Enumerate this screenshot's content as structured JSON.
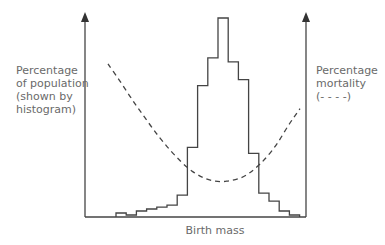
{
  "labels": {
    "left_axis": [
      "Percentage",
      "of population",
      "(shown by",
      "histogram)"
    ],
    "right_axis": [
      "Percentage",
      "mortality",
      "(- - - -)"
    ],
    "x_axis": "Birth mass"
  },
  "colors": {
    "line": "#444444",
    "text": "#6a6a6a"
  },
  "chart_data": {
    "type": "bar",
    "title": "",
    "xlabel": "Birth mass",
    "ylabel": "Percentage of population (shown by histogram)",
    "y2label": "Percentage mortality (dashed)",
    "series": [
      {
        "name": "Percentage of population (histogram)",
        "style": "step",
        "values": [
          2,
          1,
          3,
          4,
          5,
          6,
          11,
          35,
          66,
          80,
          100,
          78,
          69,
          32,
          12,
          8,
          3,
          1
        ]
      },
      {
        "name": "Percentage mortality (dashed)",
        "style": "dashed-curve",
        "values": [
          74,
          64,
          53,
          43,
          33,
          24,
          16,
          9,
          4,
          1,
          0,
          1,
          3,
          8,
          15,
          24,
          36,
          46
        ]
      }
    ],
    "categories": [
      "1",
      "2",
      "3",
      "4",
      "5",
      "6",
      "7",
      "8",
      "9",
      "10",
      "11",
      "12",
      "13",
      "14",
      "15",
      "16",
      "17",
      "18"
    ]
  }
}
